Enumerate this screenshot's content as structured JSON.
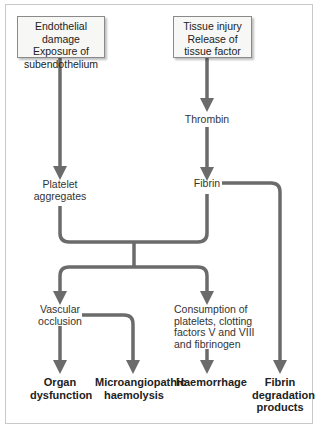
{
  "diagram": {
    "line_color": "#6b6b6b",
    "boxes": {
      "endothelial": [
        "Endothelial damage",
        "Exposure of",
        "subendothelium"
      ],
      "tissue": [
        "Tissue injury",
        "Release of",
        "tissue factor"
      ]
    },
    "nodes": {
      "thrombin": "Thrombin",
      "platelet": [
        "Platelet",
        "aggregates"
      ],
      "fibrin": "Fibrin",
      "vascular": [
        "Vascular",
        "occlusion"
      ],
      "consumption": [
        "Consumption of",
        "platelets, clotting",
        "factors V and VIII",
        "and fibrinogen"
      ]
    },
    "outcomes": {
      "organ": [
        "Organ",
        "dysfunction"
      ],
      "micro": [
        "Microangiopathic",
        "haemolysis"
      ],
      "haemorrhage": [
        "Haemorrhage"
      ],
      "fdp": [
        "Fibrin",
        "degradation",
        "products"
      ]
    }
  }
}
